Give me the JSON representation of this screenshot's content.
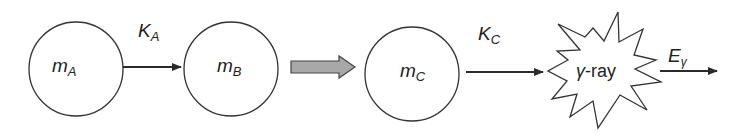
{
  "diagram": {
    "nodes": [
      {
        "id": "A",
        "label": "m",
        "sub": "A"
      },
      {
        "id": "B",
        "label": "m",
        "sub": "B"
      },
      {
        "id": "C",
        "label": "m",
        "sub": "C"
      },
      {
        "id": "gamma",
        "label_greek": "γ",
        "label_rest": "-ray"
      }
    ],
    "edges": [
      {
        "from": "A",
        "to": "B",
        "label": "K",
        "sub": "A"
      },
      {
        "from": "B",
        "to": "C",
        "style": "block-gray"
      },
      {
        "from": "C",
        "to": "gamma",
        "label": "K",
        "sub": "C"
      },
      {
        "from": "gamma",
        "to": "out",
        "label": "E",
        "sub": "γ"
      }
    ],
    "colors": {
      "stroke": "#333333",
      "block_arrow_fill": "#a8a8a8"
    }
  }
}
